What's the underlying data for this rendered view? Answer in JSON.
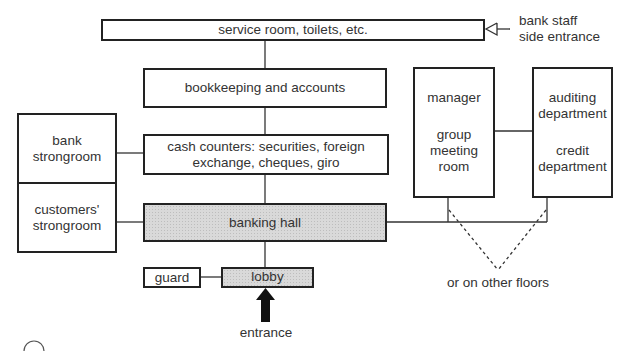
{
  "diagram": {
    "type": "bank floor plan / room relationship diagram",
    "boxes": {
      "service_room": "service room, toilets, etc.",
      "bookkeeping": "bookkeeping and accounts",
      "bank_strongroom": "bank strongroom",
      "customers_strongroom": "customers' strongroom",
      "cash_counters": "cash counters: securities, foreign exchange, cheques, giro",
      "banking_hall": "banking hall",
      "guard": "guard",
      "lobby": "lobby",
      "manager": "manager",
      "group_meeting_room": "group meeting room",
      "auditing_department": "auditing department",
      "credit_department": "credit department"
    },
    "labels": {
      "side_entrance_line1": "bank staff",
      "side_entrance_line2": "side entrance",
      "entrance": "entrance",
      "other_floors": "or on other floors"
    },
    "colors": {
      "line": "#222222",
      "shaded_fill": "#d9d9d9",
      "text": "#333333"
    }
  }
}
